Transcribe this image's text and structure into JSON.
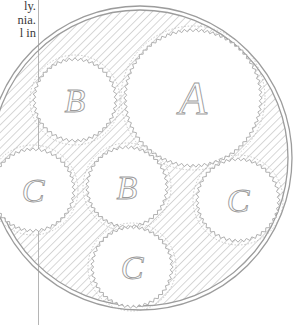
{
  "document": {
    "text_fragments": [
      "ly.",
      "nia.",
      "l in"
    ]
  },
  "figure": {
    "outer_circle": {
      "cx": 140,
      "cy": 158,
      "r": 152
    },
    "circles": [
      {
        "label": "A",
        "cx": 193,
        "cy": 98,
        "r": 67,
        "font_size": 46
      },
      {
        "label": "B",
        "cx": 75,
        "cy": 100,
        "r": 40,
        "font_size": 34
      },
      {
        "label": "B",
        "cx": 127,
        "cy": 187,
        "r": 39,
        "font_size": 34
      },
      {
        "label": "C",
        "cx": 33,
        "cy": 190,
        "r": 40,
        "font_size": 34
      },
      {
        "label": "C",
        "cx": 238,
        "cy": 200,
        "r": 40,
        "font_size": 34
      },
      {
        "label": "C",
        "cx": 132,
        "cy": 267,
        "r": 39,
        "font_size": 34
      }
    ],
    "colors": {
      "hatch": "#b0b0b0",
      "ring": "#9c9c9c",
      "teeth": "#a8a8a8",
      "label": "#9a9a9a"
    }
  }
}
